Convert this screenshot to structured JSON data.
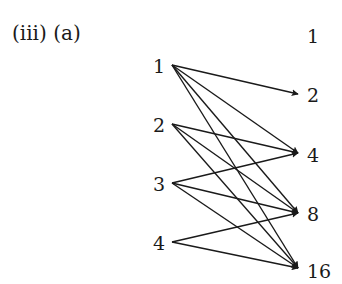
{
  "title": "(iii) (a)",
  "colors": {
    "ink": "#1a1a1a",
    "background": "#ffffff"
  },
  "left_nodes": [
    {
      "label": "1",
      "x": 153,
      "y": 57,
      "ax": 172,
      "ay": 65
    },
    {
      "label": "2",
      "x": 153,
      "y": 116,
      "ax": 172,
      "ay": 124
    },
    {
      "label": "3",
      "x": 153,
      "y": 175,
      "ax": 172,
      "ay": 183
    },
    {
      "label": "4",
      "x": 153,
      "y": 234,
      "ax": 172,
      "ay": 242
    }
  ],
  "right_nodes": [
    {
      "label": "1",
      "x": 307,
      "y": 27,
      "ax": 298,
      "ay": 35
    },
    {
      "label": "2",
      "x": 307,
      "y": 86,
      "ax": 298,
      "ay": 94
    },
    {
      "label": "4",
      "x": 307,
      "y": 146,
      "ax": 298,
      "ay": 153
    },
    {
      "label": "8",
      "x": 307,
      "y": 205,
      "ax": 298,
      "ay": 213
    },
    {
      "label": "16",
      "x": 307,
      "y": 262,
      "ax": 298,
      "ay": 268
    }
  ],
  "edges": [
    {
      "from": "1",
      "to": "2"
    },
    {
      "from": "1",
      "to": "4"
    },
    {
      "from": "1",
      "to": "8"
    },
    {
      "from": "1",
      "to": "16"
    },
    {
      "from": "2",
      "to": "4"
    },
    {
      "from": "2",
      "to": "8"
    },
    {
      "from": "2",
      "to": "16"
    },
    {
      "from": "3",
      "to": "4"
    },
    {
      "from": "3",
      "to": "8"
    },
    {
      "from": "3",
      "to": "16"
    },
    {
      "from": "4",
      "to": "8"
    },
    {
      "from": "4",
      "to": "16"
    }
  ]
}
